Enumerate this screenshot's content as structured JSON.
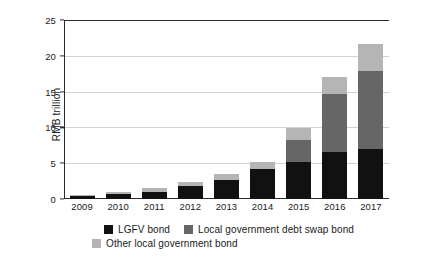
{
  "chart_data": {
    "type": "bar",
    "title": "",
    "subtitle": "",
    "xlabel": "",
    "ylabel": "RMB trillion",
    "ylim": [
      0,
      25
    ],
    "yticks": [
      0,
      5,
      10,
      15,
      20,
      25
    ],
    "ytick_labels": [
      "0",
      "5",
      "10",
      "15",
      "20",
      "25"
    ],
    "grid": true,
    "grid_axis": "y",
    "stacked": true,
    "legend_position": "bottom",
    "categories": [
      "2009",
      "2010",
      "2011",
      "2012",
      "2013",
      "2014",
      "2015",
      "2016",
      "2017"
    ],
    "series": [
      {
        "name": "LGFV bond",
        "color": "#111111",
        "values": [
          0.45,
          0.75,
          0.95,
          1.85,
          2.65,
          4.15,
          5.1,
          6.5,
          6.95
        ]
      },
      {
        "name": "Local government debt swap bond",
        "color": "#666666",
        "values": [
          0,
          0,
          0,
          0,
          0,
          0,
          3.2,
          8.1,
          10.9
        ]
      },
      {
        "name": "Other local government bond",
        "color": "#b5b5b5",
        "values": [
          0.1,
          0.2,
          0.55,
          0.55,
          0.85,
          1.05,
          1.6,
          2.5,
          3.85
        ]
      }
    ],
    "totals": [
      0.55,
      0.95,
      1.5,
      2.4,
      3.5,
      5.2,
      9.9,
      17.1,
      21.7
    ]
  },
  "axis": {
    "y_title": "RMB trillion"
  },
  "legend": {
    "items": [
      {
        "label": "LGFV bond",
        "color": "#111111"
      },
      {
        "label": "Local government debt swap bond",
        "color": "#666666"
      },
      {
        "label": "Other local government bond",
        "color": "#b5b5b5"
      }
    ]
  }
}
